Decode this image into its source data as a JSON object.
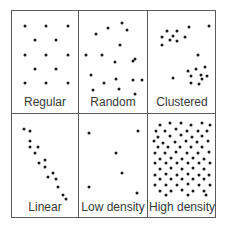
{
  "figure": {
    "panels": [
      {
        "id": "regular",
        "label": "Regular",
        "points": [
          [
            0.17,
            0.15
          ],
          [
            0.52,
            0.15
          ],
          [
            0.88,
            0.15
          ],
          [
            0.33,
            0.33
          ],
          [
            0.68,
            0.33
          ],
          [
            0.17,
            0.52
          ],
          [
            0.52,
            0.52
          ],
          [
            0.88,
            0.52
          ],
          [
            0.33,
            0.7
          ],
          [
            0.68,
            0.7
          ],
          [
            0.17,
            0.88
          ],
          [
            0.52,
            0.88
          ],
          [
            0.88,
            0.88
          ]
        ]
      },
      {
        "id": "random",
        "label": "Random",
        "points": [
          [
            0.42,
            0.18
          ],
          [
            0.23,
            0.25
          ],
          [
            0.73,
            0.2
          ],
          [
            0.65,
            0.12
          ],
          [
            0.62,
            0.4
          ],
          [
            0.33,
            0.52
          ],
          [
            0.06,
            0.53
          ],
          [
            0.82,
            0.6
          ],
          [
            0.53,
            0.62
          ],
          [
            0.86,
            0.58
          ],
          [
            0.15,
            0.78
          ],
          [
            0.83,
            0.85
          ],
          [
            0.55,
            0.83
          ],
          [
            0.97,
            0.85
          ],
          [
            0.35,
            0.88
          ],
          [
            0.18,
            0.97
          ],
          [
            0.6,
            0.96
          ],
          [
            0.86,
            1.05
          ]
        ]
      },
      {
        "id": "clustered",
        "label": "Clustered",
        "points": [
          [
            0.25,
            0.22
          ],
          [
            0.42,
            0.22
          ],
          [
            0.17,
            0.3
          ],
          [
            0.36,
            0.28
          ],
          [
            0.3,
            0.33
          ],
          [
            0.42,
            0.35
          ],
          [
            0.55,
            0.3
          ],
          [
            0.17,
            0.4
          ],
          [
            0.62,
            0.17
          ],
          [
            0.93,
            0.15
          ],
          [
            0.75,
            0.53
          ],
          [
            0.87,
            0.68
          ],
          [
            0.6,
            0.73
          ],
          [
            0.73,
            0.7
          ],
          [
            0.8,
            0.78
          ],
          [
            0.65,
            0.8
          ],
          [
            0.9,
            0.8
          ],
          [
            0.82,
            0.83
          ],
          [
            0.65,
            0.88
          ],
          [
            0.78,
            0.9
          ],
          [
            0.35,
            0.82
          ]
        ]
      },
      {
        "id": "linear",
        "label": "Linear",
        "points": [
          [
            0.15,
            0.15
          ],
          [
            0.25,
            0.18
          ],
          [
            0.25,
            0.3
          ],
          [
            0.25,
            0.38
          ],
          [
            0.38,
            0.38
          ],
          [
            0.33,
            0.45
          ],
          [
            0.4,
            0.57
          ],
          [
            0.5,
            0.54
          ],
          [
            0.5,
            0.62
          ],
          [
            0.55,
            0.75
          ],
          [
            0.63,
            0.7
          ],
          [
            0.68,
            0.78
          ],
          [
            0.72,
            0.88
          ],
          [
            0.8,
            0.97
          ],
          [
            0.85,
            1.03
          ]
        ]
      },
      {
        "id": "low_density",
        "label": "Low density",
        "points": [
          [
            0.12,
            0.2
          ],
          [
            0.9,
            0.17
          ],
          [
            0.55,
            0.45
          ],
          [
            0.65,
            0.7
          ],
          [
            0.12,
            0.88
          ],
          [
            0.88,
            0.95
          ]
        ]
      },
      {
        "id": "high_density",
        "label": "High density",
        "points": [
          [
            0.15,
            0.1
          ],
          [
            0.3,
            0.08
          ],
          [
            0.48,
            0.08
          ],
          [
            0.65,
            0.1
          ],
          [
            0.82,
            0.08
          ],
          [
            0.95,
            0.1
          ],
          [
            0.08,
            0.18
          ],
          [
            0.22,
            0.17
          ],
          [
            0.4,
            0.15
          ],
          [
            0.58,
            0.17
          ],
          [
            0.75,
            0.17
          ],
          [
            0.9,
            0.17
          ],
          [
            0.12,
            0.25
          ],
          [
            0.3,
            0.24
          ],
          [
            0.48,
            0.23
          ],
          [
            0.66,
            0.25
          ],
          [
            0.83,
            0.24
          ],
          [
            0.05,
            0.3
          ],
          [
            0.2,
            0.32
          ],
          [
            0.38,
            0.31
          ],
          [
            0.56,
            0.3
          ],
          [
            0.74,
            0.31
          ],
          [
            0.92,
            0.3
          ],
          [
            0.12,
            0.38
          ],
          [
            0.28,
            0.38
          ],
          [
            0.46,
            0.38
          ],
          [
            0.64,
            0.37
          ],
          [
            0.82,
            0.38
          ],
          [
            0.06,
            0.45
          ],
          [
            0.22,
            0.45
          ],
          [
            0.4,
            0.44
          ],
          [
            0.58,
            0.45
          ],
          [
            0.76,
            0.45
          ],
          [
            0.94,
            0.44
          ],
          [
            0.14,
            0.52
          ],
          [
            0.32,
            0.51
          ],
          [
            0.5,
            0.52
          ],
          [
            0.68,
            0.51
          ],
          [
            0.86,
            0.52
          ],
          [
            0.06,
            0.58
          ],
          [
            0.24,
            0.58
          ],
          [
            0.42,
            0.58
          ],
          [
            0.6,
            0.58
          ],
          [
            0.78,
            0.58
          ],
          [
            0.95,
            0.58
          ],
          [
            0.14,
            0.65
          ],
          [
            0.32,
            0.64
          ],
          [
            0.5,
            0.65
          ],
          [
            0.68,
            0.64
          ],
          [
            0.86,
            0.65
          ],
          [
            0.06,
            0.72
          ],
          [
            0.24,
            0.71
          ],
          [
            0.42,
            0.72
          ],
          [
            0.6,
            0.71
          ],
          [
            0.78,
            0.72
          ],
          [
            0.94,
            0.72
          ],
          [
            0.14,
            0.78
          ],
          [
            0.32,
            0.78
          ],
          [
            0.5,
            0.78
          ],
          [
            0.68,
            0.78
          ],
          [
            0.86,
            0.78
          ],
          [
            0.06,
            0.85
          ],
          [
            0.24,
            0.85
          ],
          [
            0.42,
            0.85
          ],
          [
            0.6,
            0.84
          ],
          [
            0.78,
            0.85
          ],
          [
            0.95,
            0.85
          ],
          [
            0.14,
            0.92
          ],
          [
            0.32,
            0.92
          ],
          [
            0.5,
            0.91
          ],
          [
            0.68,
            0.92
          ],
          [
            0.86,
            0.92
          ],
          [
            0.24,
            0.98
          ],
          [
            0.6,
            0.98
          ],
          [
            0.88,
            0.98
          ]
        ]
      }
    ]
  }
}
